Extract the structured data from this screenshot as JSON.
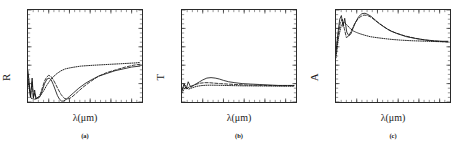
{
  "figure": {
    "background": "#ffffff",
    "ink": "#1a1a1a",
    "panel_count": 3
  },
  "chart_data": [
    {
      "type": "line",
      "panel": "a",
      "panel_label": "(a)",
      "title": "",
      "xlabel": "λ(μm)",
      "ylabel": "R",
      "xlim": [
        0,
        5.5e-05
      ],
      "ylim": [
        0.0,
        1.0
      ],
      "grid": false,
      "legend": "none",
      "xticks": [
        1e-05,
        2e-05,
        3e-05,
        4e-05,
        5e-05
      ],
      "xticklabels": [
        "1×10⁻⁵",
        "2×10⁻⁵",
        "3×10⁻⁵",
        "4×10⁻⁵",
        "5×10⁻⁵"
      ],
      "yticks": [
        0.0,
        0.2,
        0.4,
        0.6,
        0.8,
        1.0
      ],
      "yticklabels": [
        "0.0",
        "0.2",
        "0.4",
        "0.6",
        "0.8",
        "1.0"
      ],
      "series": [
        {
          "name": "solid",
          "style": "solid",
          "x": [
            0.0,
            1.2e-06,
            2e-06,
            2.6e-06,
            3.2e-06,
            3.8e-06,
            4.4e-06,
            5e-06,
            5.8e-06,
            6.8e-06,
            8e-06,
            9.2e-06,
            1.02e-05,
            1.12e-05,
            1.22e-05,
            1.32e-05,
            1.42e-05,
            1.52e-05,
            1.62e-05,
            1.72e-05,
            1.85e-05,
            2e-05,
            2.2e-05,
            2.45e-05,
            2.75e-05,
            3.05e-05,
            3.4e-05,
            3.8e-05,
            4.2e-05,
            4.6e-05,
            5e-05,
            5.4e-05
          ],
          "y": [
            0.34,
            0.05,
            0.26,
            0.04,
            0.13,
            0.03,
            0.05,
            0.04,
            0.06,
            0.12,
            0.2,
            0.25,
            0.26,
            0.24,
            0.19,
            0.13,
            0.07,
            0.03,
            0.01,
            0.01,
            0.03,
            0.06,
            0.1,
            0.15,
            0.2,
            0.24,
            0.28,
            0.31,
            0.34,
            0.36,
            0.38,
            0.39
          ]
        },
        {
          "name": "dashed",
          "style": "dashed",
          "x": [
            0.0,
            1.2e-06,
            2e-06,
            2.6e-06,
            3.2e-06,
            4e-06,
            5e-06,
            6e-06,
            7e-06,
            8e-06,
            9e-06,
            1e-05,
            1.1e-05,
            1.2e-05,
            1.32e-05,
            1.45e-05,
            1.6e-05,
            1.75e-05,
            1.9e-05,
            2.1e-05,
            2.35e-05,
            2.65e-05,
            3e-05,
            3.4e-05,
            3.8e-05,
            4.25e-05,
            4.7e-05,
            5.1e-05,
            5.4e-05
          ],
          "y": [
            0.3,
            0.06,
            0.22,
            0.05,
            0.1,
            0.04,
            0.05,
            0.09,
            0.16,
            0.23,
            0.27,
            0.29,
            0.28,
            0.25,
            0.2,
            0.14,
            0.08,
            0.04,
            0.03,
            0.05,
            0.1,
            0.16,
            0.22,
            0.28,
            0.32,
            0.35,
            0.38,
            0.4,
            0.41
          ]
        },
        {
          "name": "dotted",
          "style": "dotted",
          "x": [
            0.0,
            1.5e-06,
            3e-06,
            4.5e-06,
            6e-06,
            7.5e-06,
            9e-06,
            1.05e-05,
            1.2e-05,
            1.4e-05,
            1.6e-05,
            1.8e-05,
            2e-05,
            2.25e-05,
            2.55e-05,
            2.85e-05,
            3.2e-05,
            3.6e-05,
            4e-05,
            4.4e-05,
            4.8e-05,
            5.2e-05,
            5.4e-05
          ],
          "y": [
            0.22,
            0.04,
            0.03,
            0.04,
            0.07,
            0.12,
            0.18,
            0.23,
            0.27,
            0.31,
            0.34,
            0.36,
            0.37,
            0.38,
            0.39,
            0.395,
            0.4,
            0.405,
            0.41,
            0.415,
            0.42,
            0.425,
            0.43
          ]
        }
      ]
    },
    {
      "type": "line",
      "panel": "b",
      "panel_label": "(b)",
      "title": "",
      "xlabel": "λ(μm)",
      "ylabel": "T",
      "xlim": [
        0,
        5.5e-05
      ],
      "ylim": [
        0.0,
        1.0
      ],
      "grid": false,
      "legend": "none",
      "xticks": [
        1e-05,
        2e-05,
        3e-05,
        4e-05,
        5e-05
      ],
      "xticklabels": [
        "1×10⁻⁵",
        "2×10⁻⁵",
        "3×10⁻⁵",
        "4×10⁻⁵",
        "5×10⁻⁵"
      ],
      "yticks": [
        0.0,
        0.2,
        0.4,
        0.6,
        0.8,
        1.0
      ],
      "yticklabels": [
        "0.0",
        "0.2",
        "0.4",
        "0.6",
        "0.8",
        "1.0"
      ],
      "series": [
        {
          "name": "solid",
          "style": "solid",
          "x": [
            0.0,
            1e-06,
            2e-06,
            3e-06,
            4.2e-06,
            5.5e-06,
            7e-06,
            8.5e-06,
            1e-05,
            1.2e-05,
            1.4e-05,
            1.6e-05,
            1.8e-05,
            2e-05,
            2.25e-05,
            2.55e-05,
            2.9e-05,
            3.3e-05,
            3.75e-05,
            4.2e-05,
            4.65e-05,
            5.1e-05,
            5.4e-05
          ],
          "y": [
            0.12,
            0.2,
            0.14,
            0.22,
            0.16,
            0.18,
            0.2,
            0.22,
            0.24,
            0.26,
            0.265,
            0.26,
            0.25,
            0.235,
            0.22,
            0.21,
            0.2,
            0.195,
            0.19,
            0.185,
            0.18,
            0.18,
            0.18
          ]
        },
        {
          "name": "dashed",
          "style": "dashed",
          "x": [
            0.0,
            1.2e-06,
            2.5e-06,
            4e-06,
            5.5e-06,
            7.2e-06,
            9e-06,
            1.1e-05,
            1.3e-05,
            1.55e-05,
            1.85e-05,
            2.2e-05,
            2.6e-05,
            3.05e-05,
            3.55e-05,
            4.05e-05,
            4.55e-05,
            5.05e-05,
            5.4e-05
          ],
          "y": [
            0.13,
            0.19,
            0.15,
            0.17,
            0.18,
            0.195,
            0.205,
            0.21,
            0.21,
            0.205,
            0.2,
            0.195,
            0.19,
            0.185,
            0.182,
            0.18,
            0.178,
            0.177,
            0.177
          ]
        },
        {
          "name": "dotted",
          "style": "dotted",
          "x": [
            0.0,
            1.5e-06,
            3.2e-06,
            5e-06,
            7e-06,
            9.2e-06,
            1.15e-05,
            1.4e-05,
            1.7e-05,
            2.05e-05,
            2.45e-05,
            2.9e-05,
            3.4e-05,
            3.9e-05,
            4.4e-05,
            4.9e-05,
            5.4e-05
          ],
          "y": [
            0.1,
            0.16,
            0.14,
            0.155,
            0.17,
            0.178,
            0.182,
            0.183,
            0.182,
            0.18,
            0.178,
            0.176,
            0.175,
            0.174,
            0.173,
            0.172,
            0.172
          ]
        }
      ]
    },
    {
      "type": "line",
      "panel": "c",
      "panel_label": "(c)",
      "title": "",
      "xlabel": "λ(μm)",
      "ylabel": "A",
      "xlim": [
        0,
        5.5e-05
      ],
      "ylim": [
        0.0,
        1.0
      ],
      "grid": false,
      "legend": "none",
      "xticks": [
        1e-05,
        2e-05,
        3e-05,
        4e-05,
        5e-05
      ],
      "xticklabels": [
        "1×10⁻⁵",
        "2×10⁻⁵",
        "3×10⁻⁵",
        "4×10⁻⁵",
        "5×10⁻⁵"
      ],
      "yticks": [
        0.0,
        0.2,
        0.4,
        0.6,
        0.8,
        1.0
      ],
      "yticklabels": [
        "0.0",
        "0.2",
        "0.4",
        "0.6",
        "0.8",
        "1.0"
      ],
      "series": [
        {
          "name": "solid",
          "style": "solid",
          "x": [
            0.0,
            1e-06,
            1.8e-06,
            2.6e-06,
            3.4e-06,
            4.2e-06,
            5.2e-06,
            6.2e-06,
            7.2e-06,
            8.2e-06,
            9.5e-06,
            1.1e-05,
            1.25e-05,
            1.4e-05,
            1.55e-05,
            1.7e-05,
            1.9e-05,
            2.1e-05,
            2.35e-05,
            2.65e-05,
            3e-05,
            3.4e-05,
            3.85e-05,
            4.3e-05,
            4.75e-05,
            5.15e-05,
            5.4e-05
          ],
          "y": [
            0.55,
            0.76,
            0.9,
            0.94,
            0.82,
            0.91,
            0.76,
            0.72,
            0.74,
            0.8,
            0.87,
            0.93,
            0.96,
            0.965,
            0.95,
            0.93,
            0.89,
            0.85,
            0.81,
            0.77,
            0.74,
            0.71,
            0.69,
            0.675,
            0.665,
            0.66,
            0.66
          ]
        },
        {
          "name": "dashed",
          "style": "dashed",
          "x": [
            0.0,
            1e-06,
            2e-06,
            3e-06,
            4e-06,
            5e-06,
            6.2e-06,
            7.5e-06,
            9e-06,
            1.05e-05,
            1.2e-05,
            1.35e-05,
            1.52e-05,
            1.7e-05,
            1.92e-05,
            2.18e-05,
            2.5e-05,
            2.88e-05,
            3.3e-05,
            3.78e-05,
            4.25e-05,
            4.75e-05,
            5.2e-05,
            5.4e-05
          ],
          "y": [
            0.52,
            0.72,
            0.86,
            0.9,
            0.8,
            0.7,
            0.72,
            0.78,
            0.85,
            0.9,
            0.93,
            0.945,
            0.94,
            0.92,
            0.88,
            0.84,
            0.79,
            0.75,
            0.72,
            0.695,
            0.675,
            0.662,
            0.655,
            0.652
          ]
        },
        {
          "name": "dotted",
          "style": "dotted",
          "x": [
            0.0,
            1.2e-06,
            2.5e-06,
            3.8e-06,
            5.2e-06,
            6.8e-06,
            8.5e-06,
            1e-05,
            1.18e-05,
            1.4e-05,
            1.65e-05,
            1.95e-05,
            2.3e-05,
            2.7e-05,
            3.15e-05,
            3.65e-05,
            4.15e-05,
            4.65e-05,
            5.15e-05,
            5.4e-05
          ],
          "y": [
            0.48,
            0.7,
            0.83,
            0.87,
            0.84,
            0.8,
            0.77,
            0.755,
            0.74,
            0.725,
            0.71,
            0.7,
            0.69,
            0.68,
            0.672,
            0.666,
            0.662,
            0.658,
            0.655,
            0.654
          ]
        }
      ]
    }
  ]
}
